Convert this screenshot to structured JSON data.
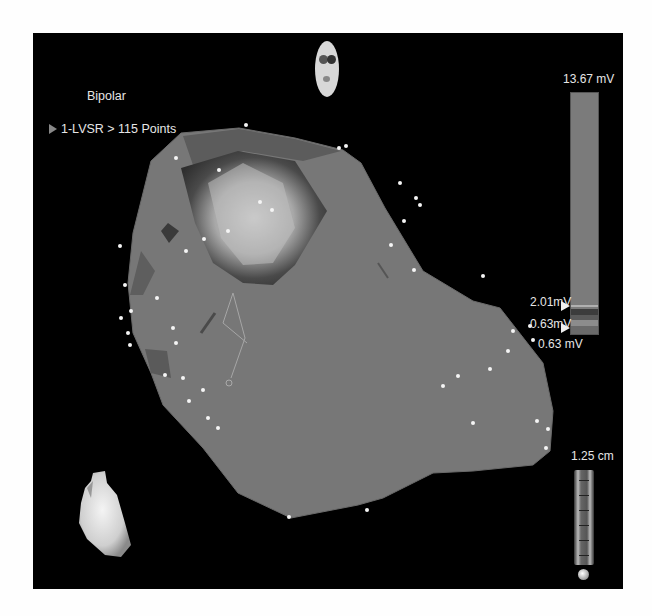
{
  "map": {
    "mode": "Bipolar",
    "map_name": "1-LVSR > 115 Points",
    "point_count": 115
  },
  "colorbar": {
    "max_label": "13.67 mV",
    "upper_threshold_label": "2.01mV",
    "lower_threshold_label": "0.63mV",
    "min_label": "0.63 mV",
    "bar_color": "#7b7b7b"
  },
  "scale": {
    "label": "1.25 cm"
  },
  "icons": {
    "orientation": "head-orientation-icon",
    "heart": "heart-thumbnail-icon",
    "ruler": "scale-ruler-icon",
    "marker": "triangle-marker-icon"
  },
  "colors": {
    "background": "#000000",
    "surface": "#787878",
    "points": "#f5f5f5",
    "text": "#e6e6e6"
  }
}
